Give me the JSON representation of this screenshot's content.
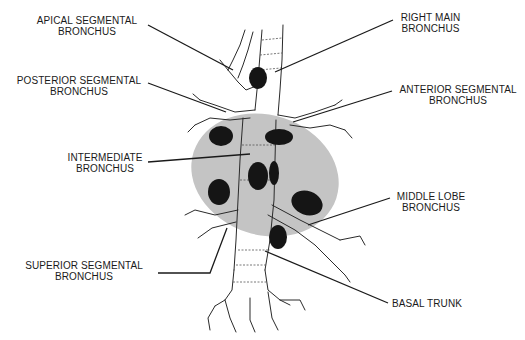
{
  "diagram": {
    "title": "",
    "colors": {
      "lung_shadow": "#c4c4c4",
      "lymph_node": "#151515",
      "outline": "#2a2a2a",
      "leader": "#1a1a1a"
    },
    "labels": [
      {
        "id": "apical-segmental-bronchus",
        "line1": "APICAL SEGMENTAL",
        "line2": "BRONCHUS"
      },
      {
        "id": "posterior-segmental-bronchus",
        "line1": "POSTERIOR SEGMENTAL",
        "line2": "BRONCHUS"
      },
      {
        "id": "intermediate-bronchus",
        "line1": "INTERMEDIATE",
        "line2": "BRONCHUS"
      },
      {
        "id": "superior-segmental-bronchus",
        "line1": "SUPERIOR SEGMENTAL",
        "line2": "BRONCHUS"
      },
      {
        "id": "right-main-bronchus",
        "line1": "RIGHT MAIN",
        "line2": "BRONCHUS"
      },
      {
        "id": "anterior-segmental-bronchus",
        "line1": "ANTERIOR SEGMENTAL",
        "line2": "BRONCHUS"
      },
      {
        "id": "middle-lobe-bronchus",
        "line1": "MIDDLE LOBE",
        "line2": "BRONCHUS"
      },
      {
        "id": "basal-trunk",
        "line1": "BASAL TRUNK",
        "line2": ""
      }
    ],
    "lymph_node_count": 8
  }
}
